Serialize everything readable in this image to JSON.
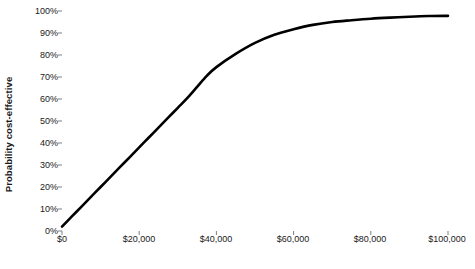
{
  "chart_data": {
    "type": "line",
    "title": "",
    "xlabel": "Benchmark Canadian dollars",
    "ylabel": "Probability cost-effective",
    "xlim": [
      0,
      100000
    ],
    "ylim": [
      0,
      1.0
    ],
    "grid": false,
    "legend": null,
    "xticks": [
      0,
      20000,
      40000,
      60000,
      80000,
      100000
    ],
    "xtick_labels": [
      "$0",
      "$20,000",
      "$40,000",
      "$60,000",
      "$80,000",
      "$100,000"
    ],
    "yticks": [
      0,
      0.1,
      0.2,
      0.3,
      0.4,
      0.5,
      0.6,
      0.7,
      0.8,
      0.9,
      1.0
    ],
    "ytick_labels": [
      "0%",
      "10%",
      "20%",
      "30%",
      "40%",
      "50%",
      "60%",
      "70%",
      "80%",
      "90%",
      "100%"
    ],
    "series": [
      {
        "name": "Cost-effectiveness acceptability curve",
        "color": "#000000",
        "line_width": 2.6,
        "x": [
          0,
          2500,
          5000,
          7500,
          10000,
          12500,
          15000,
          17500,
          20000,
          22500,
          25000,
          27500,
          30000,
          32500,
          35000,
          37500,
          40000,
          45000,
          50000,
          55000,
          60000,
          65000,
          70000,
          75000,
          80000,
          85000,
          90000,
          95000,
          100000
        ],
        "y": [
          0.02,
          0.065,
          0.11,
          0.155,
          0.2,
          0.245,
          0.29,
          0.335,
          0.38,
          0.425,
          0.47,
          0.515,
          0.56,
          0.605,
          0.655,
          0.705,
          0.745,
          0.805,
          0.855,
          0.892,
          0.917,
          0.937,
          0.95,
          0.958,
          0.965,
          0.97,
          0.974,
          0.977,
          0.978
        ]
      }
    ],
    "axis_color": "#808080",
    "tick_color": "#808080",
    "text_color": "#1a1a1a",
    "plot_top_border": true,
    "plot_right_border": true
  }
}
